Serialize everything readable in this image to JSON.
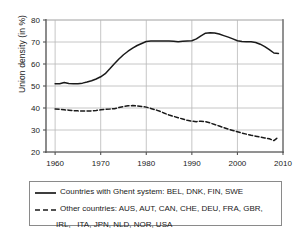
{
  "chart_data": {
    "type": "line",
    "title": "",
    "xlabel": "",
    "ylabel": "Union density (in %)",
    "xlim": [
      1958,
      2010
    ],
    "ylim": [
      20,
      80
    ],
    "xticks": [
      1960,
      1970,
      1980,
      1990,
      2000,
      2010
    ],
    "yticks": [
      20,
      30,
      40,
      50,
      60,
      70,
      80
    ],
    "grid": true,
    "legend_position": "below-plot",
    "series": [
      {
        "name": "Countries with Ghent system: BEL, DNK, FIN, SWE",
        "style": "solid",
        "color": "#1a1a1a",
        "x": [
          1960,
          1961,
          1962,
          1963,
          1964,
          1965,
          1966,
          1967,
          1968,
          1969,
          1970,
          1971,
          1972,
          1973,
          1974,
          1975,
          1976,
          1977,
          1978,
          1979,
          1980,
          1981,
          1982,
          1983,
          1984,
          1985,
          1986,
          1987,
          1988,
          1989,
          1990,
          1991,
          1992,
          1993,
          1994,
          1995,
          1996,
          1997,
          1998,
          1999,
          2000,
          2001,
          2002,
          2003,
          2004,
          2005,
          2006,
          2007,
          2008,
          2009
        ],
        "values": [
          51.0,
          51.0,
          51.6,
          51.1,
          51.0,
          51.0,
          51.3,
          51.8,
          52.4,
          53.2,
          54.2,
          55.6,
          57.8,
          60.1,
          62.3,
          64.2,
          65.8,
          67.2,
          68.4,
          69.3,
          70.2,
          70.4,
          70.4,
          70.4,
          70.5,
          70.5,
          70.3,
          70.1,
          70.3,
          70.5,
          70.6,
          71.4,
          72.8,
          74.0,
          74.2,
          74.1,
          73.6,
          72.9,
          72.2,
          71.4,
          70.6,
          70.2,
          70.1,
          70.1,
          69.8,
          69.0,
          67.9,
          66.5,
          65.0,
          64.8
        ]
      },
      {
        "name": "Other countries: AUS, AUT, CAN, CHE, DEU, FRA, GBR, IRL,  ITA, JPN, NLD, NOR, USA",
        "style": "dashed",
        "color": "#1a1a1a",
        "x": [
          1960,
          1961,
          1962,
          1963,
          1964,
          1965,
          1966,
          1967,
          1968,
          1969,
          1970,
          1971,
          1972,
          1973,
          1974,
          1975,
          1976,
          1977,
          1978,
          1979,
          1980,
          1981,
          1982,
          1983,
          1984,
          1985,
          1986,
          1987,
          1988,
          1989,
          1990,
          1991,
          1992,
          1993,
          1994,
          1995,
          1996,
          1997,
          1998,
          1999,
          2000,
          2001,
          2002,
          2003,
          2004,
          2005,
          2006,
          2007,
          2008,
          2009
        ],
        "values": [
          39.5,
          39.4,
          39.2,
          39.0,
          38.8,
          38.7,
          38.6,
          38.6,
          38.7,
          38.9,
          39.2,
          39.4,
          39.5,
          39.7,
          40.2,
          40.7,
          41.0,
          41.1,
          40.9,
          40.7,
          40.4,
          39.8,
          39.2,
          38.5,
          37.6,
          36.8,
          36.2,
          35.6,
          35.0,
          34.4,
          34.0,
          33.8,
          34.0,
          33.8,
          33.2,
          32.5,
          31.8,
          31.1,
          30.4,
          29.8,
          29.2,
          28.6,
          28.1,
          27.6,
          27.2,
          26.8,
          26.4,
          26.0,
          25.2,
          26.8
        ]
      }
    ]
  },
  "axes": {
    "y_axis_label": "Union density (in %)",
    "x_tick_labels": [
      "1960",
      "1970",
      "1980",
      "1990",
      "2000",
      "2010"
    ],
    "y_tick_labels": [
      "20",
      "30",
      "40",
      "50",
      "60",
      "70",
      "80"
    ]
  },
  "legend": {
    "entry1_label": "Countries with Ghent system: BEL, DNK, FIN, SWE",
    "entry2_label": "Other countries: AUS, AUT, CAN, CHE, DEU, FRA, GBR,",
    "entry2_label_line2": "IRL,   ITA, JPN, NLD, NOR, USA"
  },
  "colors": {
    "line": "#1a1a1a",
    "grid": "#b8b8b8",
    "axis": "#555555",
    "legend_border": "#8a8a8a",
    "background": "#ffffff"
  }
}
